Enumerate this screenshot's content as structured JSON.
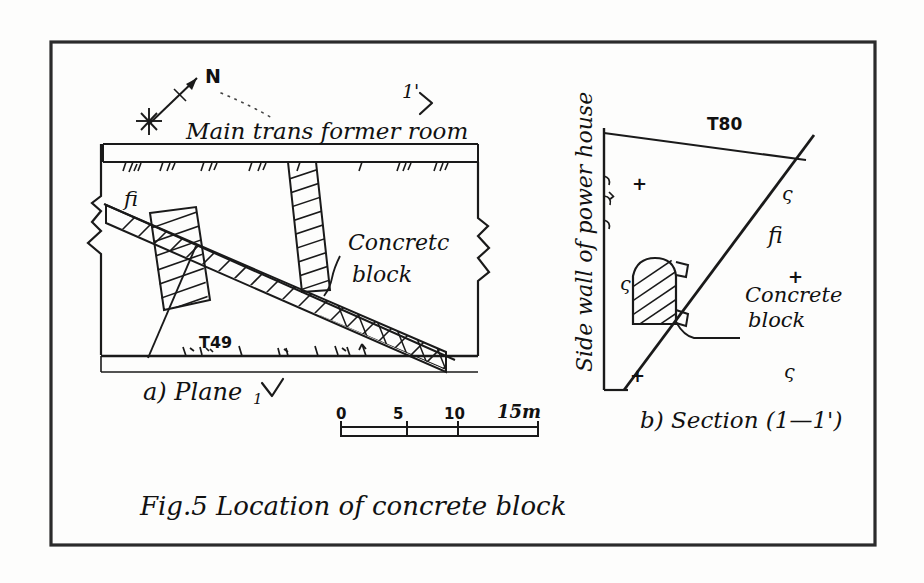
{
  "figure": {
    "caption": "Fig.5   Location of concrete block",
    "border_color": "#2b2b2b",
    "ink_color": "#1a1a1a",
    "background_color": "#fdfdfc"
  },
  "plan": {
    "subcaption": "a) Plane",
    "room_label": "Main trans former room",
    "north_label": "N",
    "fault_label": "fi",
    "borehole_label": "T49",
    "block_label_line1": "Concretc",
    "block_label_line2": "block",
    "section_marker_start": "1",
    "section_marker_end": "1'"
  },
  "section": {
    "subcaption": "b) Section (1—1')",
    "wall_label": "Side wall of power house",
    "borehole_label": "T80",
    "fault_label": "fi",
    "block_label_line1": "Concrete",
    "block_label_line2": "block",
    "markers": [
      {
        "glyph": "+",
        "x": 632,
        "y": 190
      },
      {
        "glyph": "ς",
        "x": 782,
        "y": 200
      },
      {
        "glyph": "ς",
        "x": 620,
        "y": 290
      },
      {
        "glyph": "+",
        "x": 788,
        "y": 283
      },
      {
        "glyph": "+",
        "x": 630,
        "y": 382
      },
      {
        "glyph": "ς",
        "x": 784,
        "y": 378
      }
    ]
  },
  "scale_bar": {
    "unit_suffix": "15m",
    "ticks": [
      "0",
      "5",
      "10"
    ],
    "label_0": "0",
    "label_5": "5",
    "label_10": "10",
    "label_15": "15m"
  }
}
